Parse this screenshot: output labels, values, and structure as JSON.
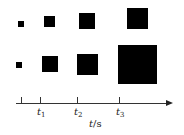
{
  "diagram": {
    "rows": [
      {
        "name": "row-1",
        "squares": [
          {
            "x": 18,
            "y": 21,
            "size": 6
          },
          {
            "x": 44,
            "y": 16,
            "size": 11
          },
          {
            "x": 79,
            "y": 13,
            "size": 16
          },
          {
            "x": 127,
            "y": 8,
            "size": 21
          }
        ]
      },
      {
        "name": "row-2",
        "squares": [
          {
            "x": 16,
            "y": 62,
            "size": 6
          },
          {
            "x": 42,
            "y": 56,
            "size": 16
          },
          {
            "x": 77,
            "y": 54,
            "size": 21
          },
          {
            "x": 118,
            "y": 45,
            "size": 39
          }
        ]
      }
    ],
    "axis": {
      "tick_labels": [
        {
          "base": "",
          "sub": ""
        },
        {
          "base": "t",
          "sub": "1"
        },
        {
          "base": "t",
          "sub": "2"
        },
        {
          "base": "t",
          "sub": "3"
        }
      ],
      "unit_var": "t",
      "unit_rest": "/s"
    },
    "color": "#000000"
  }
}
